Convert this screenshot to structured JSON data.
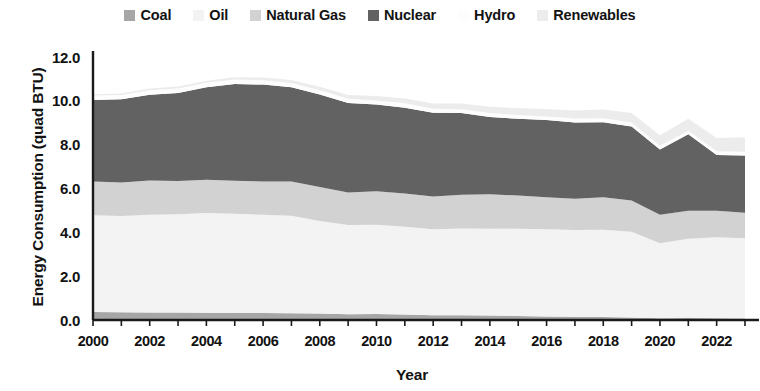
{
  "legend": {
    "position": "top",
    "items": [
      {
        "label": "Coal",
        "color": "#a6a6a6"
      },
      {
        "label": "Oil",
        "color": "#f3f3f3"
      },
      {
        "label": "Natural Gas",
        "color": "#d2d2d2"
      },
      {
        "label": "Nuclear",
        "color": "#626262"
      },
      {
        "label": "Hydro",
        "color": "#fdfdfd"
      },
      {
        "label": "Renewables",
        "color": "#ececec"
      }
    ]
  },
  "axes": {
    "y_title": "Energy Consumption (quad BTU)",
    "x_title": "Year",
    "y_ticks": [
      "0.0",
      "2.0",
      "4.0",
      "6.0",
      "8.0",
      "10.0",
      "12.0"
    ],
    "x_ticks": [
      "2000",
      "2002",
      "2004",
      "2006",
      "2008",
      "2010",
      "2012",
      "2014",
      "2016",
      "2018",
      "2020",
      "2022"
    ]
  },
  "chart_data": {
    "type": "area",
    "stacked": true,
    "title": "",
    "xlabel": "Year",
    "ylabel": "Energy Consumption (quad BTU)",
    "xlim": [
      2000,
      2023
    ],
    "ylim": [
      0.0,
      12.0
    ],
    "ytick_step": 2.0,
    "xtick_step": 2,
    "grid": false,
    "legend_position": "top",
    "x": [
      2000,
      2001,
      2002,
      2003,
      2004,
      2005,
      2006,
      2007,
      2008,
      2009,
      2010,
      2011,
      2012,
      2013,
      2014,
      2015,
      2016,
      2017,
      2018,
      2019,
      2020,
      2021,
      2022,
      2023
    ],
    "series": [
      {
        "name": "Coal",
        "color": "#a6a6a6",
        "values": [
          0.36,
          0.35,
          0.34,
          0.34,
          0.33,
          0.33,
          0.32,
          0.31,
          0.3,
          0.26,
          0.27,
          0.25,
          0.22,
          0.22,
          0.21,
          0.18,
          0.16,
          0.15,
          0.14,
          0.11,
          0.08,
          0.09,
          0.08,
          0.07
        ]
      },
      {
        "name": "Oil",
        "color": "#f3f3f3",
        "values": [
          4.42,
          4.4,
          4.46,
          4.48,
          4.55,
          4.52,
          4.48,
          4.45,
          4.22,
          4.08,
          4.08,
          4.0,
          3.92,
          3.95,
          3.95,
          3.98,
          3.98,
          3.96,
          3.98,
          3.92,
          3.42,
          3.62,
          3.7,
          3.66
        ]
      },
      {
        "name": "Natural Gas",
        "color": "#d2d2d2",
        "values": [
          1.54,
          1.52,
          1.56,
          1.52,
          1.52,
          1.5,
          1.52,
          1.56,
          1.55,
          1.48,
          1.52,
          1.52,
          1.5,
          1.55,
          1.58,
          1.52,
          1.46,
          1.42,
          1.48,
          1.42,
          1.3,
          1.28,
          1.2,
          1.16
        ]
      },
      {
        "name": "Nuclear",
        "color": "#626262",
        "values": [
          3.72,
          3.8,
          3.92,
          4.02,
          4.22,
          4.42,
          4.42,
          4.3,
          4.22,
          4.08,
          3.96,
          3.92,
          3.82,
          3.72,
          3.52,
          3.5,
          3.52,
          3.48,
          3.42,
          3.38,
          2.98,
          3.48,
          2.55,
          2.62
        ]
      },
      {
        "name": "Hydro",
        "color": "#fdfdfd",
        "values": [
          0.2,
          0.2,
          0.2,
          0.2,
          0.2,
          0.2,
          0.2,
          0.19,
          0.19,
          0.19,
          0.19,
          0.2,
          0.18,
          0.18,
          0.18,
          0.17,
          0.17,
          0.18,
          0.18,
          0.18,
          0.17,
          0.17,
          0.17,
          0.17
        ]
      },
      {
        "name": "Renewables",
        "color": "#ececec",
        "values": [
          0.06,
          0.07,
          0.08,
          0.09,
          0.1,
          0.11,
          0.12,
          0.14,
          0.16,
          0.18,
          0.2,
          0.22,
          0.24,
          0.26,
          0.29,
          0.31,
          0.34,
          0.37,
          0.4,
          0.44,
          0.48,
          0.54,
          0.6,
          0.66
        ]
      }
    ],
    "totals": [
      10.3,
      10.34,
      10.56,
      10.65,
      10.92,
      11.08,
      11.06,
      10.95,
      10.64,
      10.27,
      10.22,
      10.11,
      9.88,
      9.88,
      9.73,
      9.66,
      9.63,
      9.56,
      9.6,
      9.45,
      8.43,
      9.18,
      8.3,
      8.34
    ]
  },
  "style": {
    "plot_left": 93,
    "plot_right": 745,
    "plot_top": 57,
    "plot_bottom": 320,
    "axis_color": "#1a1a1a"
  }
}
